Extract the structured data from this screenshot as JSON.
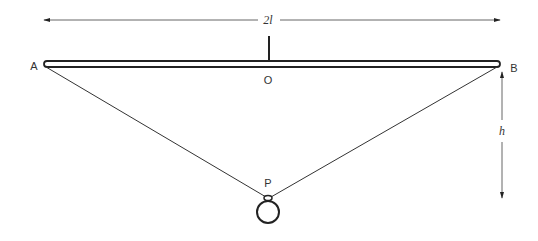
{
  "diagram": {
    "labels": {
      "point_a": "A",
      "point_b": "B",
      "point_o": "O",
      "point_p": "P",
      "span": "2l",
      "height": "h"
    },
    "dimensions": {
      "span_arrow": "2l",
      "height_arrow": "h"
    },
    "colors": {
      "stroke": "#222222",
      "label": "#333333",
      "background": "#ffffff"
    }
  }
}
